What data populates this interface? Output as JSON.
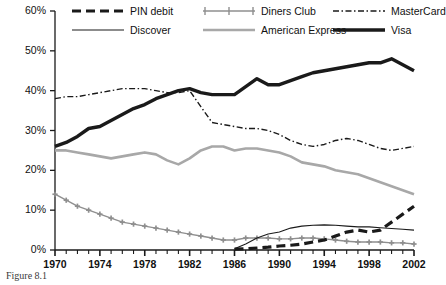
{
  "caption": "Figure 8.1",
  "chart_data": {
    "type": "line",
    "title": "",
    "subtitle": "",
    "xlabel": "",
    "ylabel": "",
    "xlim": [
      1970,
      2002
    ],
    "ylim": [
      0,
      60
    ],
    "ytick_labels": [
      "0%",
      "10%",
      "20%",
      "30%",
      "40%",
      "50%",
      "60%"
    ],
    "ytick_values": [
      0,
      10,
      20,
      30,
      40,
      50,
      60
    ],
    "xtick_labels": [
      "1970",
      "1974",
      "1978",
      "1982",
      "1986",
      "1990",
      "1994",
      "1998",
      "2002"
    ],
    "xtick_values": [
      1970,
      1974,
      1978,
      1982,
      1986,
      1990,
      1994,
      1998,
      2002
    ],
    "x_minor_ticks_every": 1,
    "grid": false,
    "legend_position": "top",
    "x": [
      1970,
      1971,
      1972,
      1973,
      1974,
      1975,
      1976,
      1977,
      1978,
      1979,
      1980,
      1981,
      1982,
      1983,
      1984,
      1985,
      1986,
      1987,
      1988,
      1989,
      1990,
      1991,
      1992,
      1993,
      1994,
      1995,
      1996,
      1997,
      1998,
      1999,
      2000,
      2001,
      2002
    ],
    "series": [
      {
        "name": "Visa",
        "color": "#1a1a1a",
        "style": "solid-thick",
        "values": [
          26.0,
          27.0,
          28.5,
          30.5,
          31.0,
          32.5,
          34.0,
          35.5,
          36.5,
          38.0,
          39.0,
          40.0,
          40.5,
          39.5,
          39.0,
          39.0,
          39.0,
          41.0,
          43.0,
          41.5,
          41.5,
          42.5,
          43.5,
          44.5,
          45.0,
          45.5,
          46.0,
          46.5,
          47.0,
          47.0,
          48.0,
          46.5,
          45.0
        ]
      },
      {
        "name": "MasterCard",
        "color": "#1a1a1a",
        "style": "dash-dot",
        "values": [
          38.0,
          38.5,
          38.5,
          39.0,
          39.5,
          40.0,
          40.5,
          40.5,
          40.5,
          40.0,
          39.5,
          39.5,
          40.0,
          36.0,
          32.0,
          31.5,
          31.0,
          30.5,
          30.5,
          30.0,
          29.0,
          27.5,
          26.5,
          26.0,
          26.5,
          27.5,
          28.0,
          27.5,
          26.5,
          25.5,
          25.0,
          25.5,
          26.0
        ]
      },
      {
        "name": "American Express",
        "color": "#a8a8a8",
        "style": "solid-medium",
        "values": [
          25.0,
          25.0,
          24.5,
          24.0,
          23.5,
          23.0,
          23.5,
          24.0,
          24.5,
          24.0,
          22.5,
          21.5,
          23.0,
          25.0,
          26.0,
          26.0,
          25.0,
          25.5,
          25.5,
          25.0,
          24.5,
          23.5,
          22.0,
          21.5,
          21.0,
          20.0,
          19.5,
          19.0,
          18.0,
          17.0,
          16.0,
          15.0,
          14.0
        ]
      },
      {
        "name": "Diners Club",
        "color": "#8f8f8f",
        "style": "plus-markers",
        "values": [
          14.0,
          12.5,
          11.0,
          10.0,
          9.0,
          8.0,
          7.0,
          6.5,
          6.0,
          5.5,
          5.0,
          4.5,
          4.0,
          3.5,
          3.0,
          2.5,
          2.5,
          3.0,
          3.0,
          3.0,
          2.8,
          2.8,
          3.0,
          3.0,
          2.8,
          2.5,
          2.2,
          2.0,
          2.0,
          2.0,
          1.8,
          1.8,
          1.5
        ]
      },
      {
        "name": "Discover",
        "color": "#1a1a1a",
        "style": "solid-thin",
        "values": [
          null,
          null,
          null,
          null,
          null,
          null,
          null,
          null,
          null,
          null,
          null,
          null,
          null,
          null,
          null,
          null,
          0.3,
          1.5,
          3.0,
          4.0,
          4.5,
          5.5,
          6.0,
          6.2,
          6.3,
          6.2,
          6.0,
          5.8,
          5.8,
          5.6,
          5.4,
          5.2,
          5.0
        ]
      },
      {
        "name": "PIN debit",
        "color": "#1a1a1a",
        "style": "dashed-thick",
        "values": [
          null,
          null,
          null,
          null,
          null,
          null,
          null,
          null,
          null,
          null,
          null,
          null,
          null,
          null,
          null,
          null,
          0.2,
          0.3,
          0.5,
          0.7,
          1.0,
          1.2,
          1.5,
          2.0,
          2.5,
          3.5,
          4.5,
          5.0,
          4.5,
          5.0,
          7.0,
          9.0,
          11.0
        ]
      }
    ]
  },
  "legend": {
    "rows": [
      [
        {
          "name": "PIN debit",
          "style": "dashed-thick"
        },
        {
          "name": "Diners Club",
          "style": "plus-markers"
        },
        {
          "name": "MasterCard",
          "style": "dash-dot"
        }
      ],
      [
        {
          "name": "Discover",
          "style": "solid-thin"
        },
        {
          "name": "American Express",
          "style": "solid-medium"
        },
        {
          "name": "Visa",
          "style": "solid-thick"
        }
      ]
    ]
  }
}
